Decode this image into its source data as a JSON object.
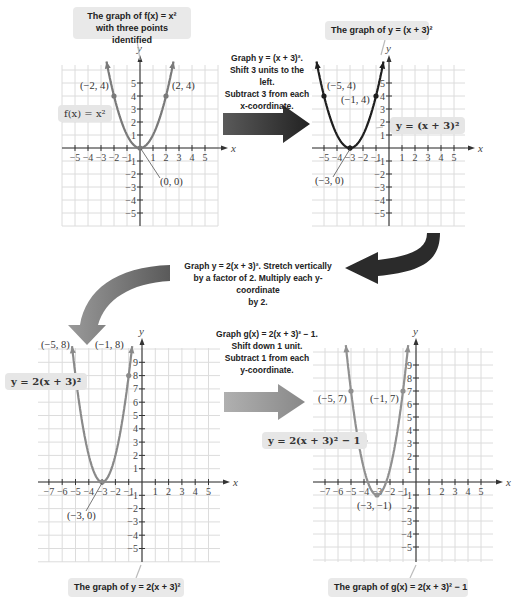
{
  "colors": {
    "grid": "#dcdcdc",
    "axis": "#333333",
    "curve1": "#7a7a7a",
    "curve2": "#1f1f1f",
    "curve3": "#8a8a8a",
    "curve4": "#909090",
    "callout_bg": "#e9e9e9",
    "arrow_dark": "#2a2a2a",
    "arrow_mid": "#777777",
    "arrow_light": "#9a9a9a"
  },
  "graphs": [
    {
      "id": "g1",
      "callout": "The graph of f(x) = x² with three points identified",
      "callout_line1": "The graph of f(x) = x²",
      "callout_line2": "with three points identified",
      "equation_label": "f(x) = x²",
      "points": [
        {
          "label": "(−2, 4)"
        },
        {
          "label": "(2, 4)"
        },
        {
          "label": "(0, 0)"
        }
      ]
    },
    {
      "id": "g2",
      "callout": "The graph of y = (x + 3)²",
      "equation_label": "y = (x + 3)²",
      "points": [
        {
          "label": "(−5, 4)"
        },
        {
          "label": "(−1, 4)"
        },
        {
          "label": "(−3, 0)"
        }
      ]
    },
    {
      "id": "g3",
      "callout": "The graph of y = 2(x + 3)²",
      "equation_label": "y = 2(x + 3)²",
      "points": [
        {
          "label": "(−5, 8)"
        },
        {
          "label": "(−1, 8)"
        },
        {
          "label": "(−3, 0)"
        }
      ]
    },
    {
      "id": "g4",
      "callout": "The graph of g(x) = 2(x + 3)² − 1",
      "equation_label": "y = 2(x + 3)² − 1",
      "points": [
        {
          "label": "(−5, 7)"
        },
        {
          "label": "(−1, 7)"
        },
        {
          "label": "(−3, −1)"
        }
      ]
    }
  ],
  "steps": [
    {
      "line1": "Graph y = (x + 3)².",
      "line2": "Shift 3 units to the left.",
      "line3": "Subtract 3 from each",
      "line4": "x-coordinate."
    },
    {
      "line1": "Graph y = 2(x + 3)². Stretch vertically",
      "line2": "by a factor of 2. Multiply each y-coordinate",
      "line3": "by 2."
    },
    {
      "line1": "Graph g(x) = 2(x + 3)² − 1.",
      "line2": "Shift down 1 unit.",
      "line3": "Subtract 1 from each",
      "line4": "y-coordinate."
    }
  ],
  "axes": {
    "x": "x",
    "y": "y"
  },
  "chart_data": [
    {
      "type": "line",
      "title": "The graph of f(x) = x²",
      "function": "x^2",
      "x_ticks": [
        -5,
        -4,
        -3,
        -2,
        -1,
        1,
        2,
        3,
        4,
        5
      ],
      "y_ticks": [
        -5,
        -4,
        -3,
        -2,
        -1,
        1,
        2,
        3,
        4,
        5
      ],
      "xlim": [
        -6,
        6
      ],
      "ylim": [
        -6,
        6
      ],
      "points": [
        [
          -2,
          4
        ],
        [
          0,
          0
        ],
        [
          2,
          4
        ]
      ],
      "grid": true
    },
    {
      "type": "line",
      "title": "The graph of y = (x + 3)²",
      "function": "(x+3)^2",
      "x_ticks": [
        -5,
        -4,
        -3,
        -2,
        -1,
        1,
        2,
        3,
        4,
        5
      ],
      "y_ticks": [
        -5,
        -4,
        -3,
        -2,
        -1,
        1,
        2,
        3,
        4,
        5
      ],
      "xlim": [
        -6,
        6
      ],
      "ylim": [
        -6,
        6
      ],
      "points": [
        [
          -5,
          4
        ],
        [
          -3,
          0
        ],
        [
          -1,
          4
        ]
      ],
      "grid": true
    },
    {
      "type": "line",
      "title": "The graph of y = 2(x + 3)²",
      "function": "2(x+3)^2",
      "x_ticks": [
        -7,
        -6,
        -5,
        -4,
        -3,
        -2,
        -1,
        1,
        2,
        3,
        4,
        5
      ],
      "y_ticks": [
        -5,
        -4,
        -3,
        -2,
        -1,
        1,
        2,
        3,
        4,
        5,
        6,
        7,
        8,
        9
      ],
      "xlim": [
        -8,
        6
      ],
      "ylim": [
        -6,
        10
      ],
      "points": [
        [
          -5,
          8
        ],
        [
          -3,
          0
        ],
        [
          -1,
          8
        ]
      ],
      "grid": true
    },
    {
      "type": "line",
      "title": "The graph of g(x) = 2(x + 3)² − 1",
      "function": "2(x+3)^2-1",
      "x_ticks": [
        -7,
        -6,
        -5,
        -4,
        -3,
        -2,
        -1,
        1,
        2,
        3,
        4,
        5
      ],
      "y_ticks": [
        -5,
        -4,
        -3,
        -2,
        -1,
        1,
        2,
        3,
        4,
        5,
        6,
        7,
        8,
        9
      ],
      "xlim": [
        -8,
        6
      ],
      "ylim": [
        -6,
        10
      ],
      "points": [
        [
          -5,
          7
        ],
        [
          -3,
          -1
        ],
        [
          -1,
          7
        ]
      ],
      "grid": true
    }
  ]
}
